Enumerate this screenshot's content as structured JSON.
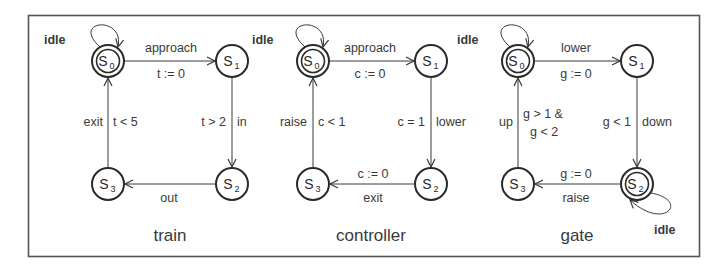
{
  "diagram": {
    "colors": {
      "stroke": "#3a3a3a",
      "text": "#3a3a3a",
      "border": "#555555",
      "background": "#ffffff"
    },
    "automata": [
      {
        "name": "train",
        "states": [
          {
            "id": "S0",
            "label": "S",
            "sub": "0",
            "accepting": true
          },
          {
            "id": "S1",
            "label": "S",
            "sub": "1",
            "accepting": false
          },
          {
            "id": "S2",
            "label": "S",
            "sub": "2",
            "accepting": false
          },
          {
            "id": "S3",
            "label": "S",
            "sub": "3",
            "accepting": false
          }
        ],
        "transitions": [
          {
            "from": "S0",
            "to": "S0",
            "action": "idle",
            "guard": ""
          },
          {
            "from": "S0",
            "to": "S1",
            "action": "approach",
            "guard": "t := 0"
          },
          {
            "from": "S1",
            "to": "S2",
            "action": "in",
            "guard": "t > 2"
          },
          {
            "from": "S2",
            "to": "S3",
            "action": "out",
            "guard": ""
          },
          {
            "from": "S3",
            "to": "S0",
            "action": "exit",
            "guard": "t < 5"
          }
        ]
      },
      {
        "name": "controller",
        "states": [
          {
            "id": "S0",
            "label": "S",
            "sub": "0",
            "accepting": true
          },
          {
            "id": "S1",
            "label": "S",
            "sub": "1",
            "accepting": false
          },
          {
            "id": "S2",
            "label": "S",
            "sub": "2",
            "accepting": false
          },
          {
            "id": "S3",
            "label": "S",
            "sub": "3",
            "accepting": false
          }
        ],
        "transitions": [
          {
            "from": "S0",
            "to": "S0",
            "action": "idle",
            "guard": ""
          },
          {
            "from": "S0",
            "to": "S1",
            "action": "approach",
            "guard": "c := 0"
          },
          {
            "from": "S1",
            "to": "S2",
            "action": "lower",
            "guard": "c = 1"
          },
          {
            "from": "S2",
            "to": "S3",
            "action": "exit",
            "guard": "c := 0"
          },
          {
            "from": "S3",
            "to": "S0",
            "action": "raise",
            "guard": "c < 1"
          }
        ]
      },
      {
        "name": "gate",
        "states": [
          {
            "id": "S0",
            "label": "S",
            "sub": "0",
            "accepting": true
          },
          {
            "id": "S1",
            "label": "S",
            "sub": "1",
            "accepting": false
          },
          {
            "id": "S2",
            "label": "S",
            "sub": "2",
            "accepting": true
          },
          {
            "id": "S3",
            "label": "S",
            "sub": "3",
            "accepting": false
          }
        ],
        "transitions": [
          {
            "from": "S0",
            "to": "S0",
            "action": "idle",
            "guard": ""
          },
          {
            "from": "S0",
            "to": "S1",
            "action": "lower",
            "guard": "g := 0"
          },
          {
            "from": "S1",
            "to": "S2",
            "action": "down",
            "guard": "g < 1"
          },
          {
            "from": "S2",
            "to": "S2",
            "action": "idle",
            "guard": ""
          },
          {
            "from": "S2",
            "to": "S3",
            "action": "raise",
            "guard": "g := 0"
          },
          {
            "from": "S3",
            "to": "S0",
            "action": "up",
            "guard_line1": "g > 1 &",
            "guard_line2": "g < 2"
          }
        ]
      }
    ]
  }
}
